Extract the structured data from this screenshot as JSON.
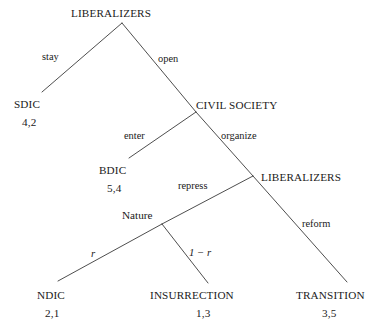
{
  "figure": {
    "type": "game-tree",
    "background_color": "#ffffff",
    "line_color": "#3a3a3a",
    "text_color": "#1a1a1a"
  },
  "nodes": {
    "root": {
      "label": "LIBERALIZERS",
      "x": 122,
      "y": 23,
      "text_x": 71,
      "text_y": 17
    },
    "civil_society": {
      "label": "CIVIL SOCIETY",
      "x": 196,
      "y": 112,
      "text_x": 196,
      "text_y": 109
    },
    "liberalizers2": {
      "label": "LIBERALIZERS",
      "x": 253,
      "y": 176,
      "text_x": 261,
      "text_y": 181
    },
    "nature": {
      "label": "Nature",
      "x": 162,
      "y": 224,
      "text_x": 122,
      "text_y": 219
    }
  },
  "terminals": [
    {
      "name": "SDIC",
      "label": "SDIC",
      "payoff": "4,2",
      "x": 42,
      "y": 92,
      "text_x": 14,
      "text_y": 108,
      "payoff_x": 22,
      "payoff_y": 126
    },
    {
      "name": "BDIC",
      "label": "BDIC",
      "payoff": "5,4",
      "x": 129,
      "y": 158,
      "text_x": 99,
      "text_y": 174,
      "payoff_x": 107,
      "payoff_y": 192
    },
    {
      "name": "NDIC",
      "label": "NDIC",
      "payoff": "2,1",
      "x": 58,
      "y": 281,
      "text_x": 37,
      "text_y": 299,
      "payoff_x": 45,
      "payoff_y": 317
    },
    {
      "name": "INSURRECTION",
      "label": "INSURRECTION",
      "payoff": "1,3",
      "x": 208,
      "y": 283,
      "text_x": 150,
      "text_y": 299,
      "payoff_x": 196,
      "payoff_y": 317
    },
    {
      "name": "TRANSITION",
      "label": "TRANSITION",
      "payoff": "3,5",
      "x": 347,
      "y": 282,
      "text_x": 296,
      "text_y": 299,
      "payoff_x": 322,
      "payoff_y": 317
    }
  ],
  "edges": [
    {
      "name": "root-to-sdic",
      "x1": 122,
      "y1": 23,
      "x2": 42,
      "y2": 92
    },
    {
      "name": "root-to-civil-society",
      "x1": 122,
      "y1": 23,
      "x2": 196,
      "y2": 112
    },
    {
      "name": "civil-society-to-bdic",
      "x1": 196,
      "y1": 112,
      "x2": 129,
      "y2": 158
    },
    {
      "name": "civil-society-to-liberalizers2",
      "x1": 196,
      "y1": 112,
      "x2": 253,
      "y2": 176
    },
    {
      "name": "liberalizers2-to-nature",
      "x1": 253,
      "y1": 176,
      "x2": 162,
      "y2": 224
    },
    {
      "name": "liberalizers2-to-transition",
      "x1": 253,
      "y1": 176,
      "x2": 347,
      "y2": 282
    },
    {
      "name": "nature-to-ndic",
      "x1": 162,
      "y1": 224,
      "x2": 58,
      "y2": 281
    },
    {
      "name": "nature-to-insurrection",
      "x1": 162,
      "y1": 224,
      "x2": 208,
      "y2": 283
    }
  ],
  "action_labels": [
    {
      "name": "stay",
      "text": "stay",
      "x": 42,
      "y": 60
    },
    {
      "name": "open",
      "text": "open",
      "x": 158,
      "y": 62
    },
    {
      "name": "enter",
      "text": "enter",
      "x": 124,
      "y": 139
    },
    {
      "name": "organize",
      "text": "organize",
      "x": 221,
      "y": 139
    },
    {
      "name": "repress",
      "text": "repress",
      "x": 178,
      "y": 189
    },
    {
      "name": "reform",
      "text": "reform",
      "x": 302,
      "y": 227
    }
  ],
  "probability_labels": [
    {
      "name": "prob-r",
      "text": "r",
      "x": 91,
      "y": 257,
      "italic": true
    },
    {
      "name": "prob-one-minus-r",
      "text": "1 − r",
      "x": 189,
      "y": 256,
      "italic": true
    }
  ]
}
